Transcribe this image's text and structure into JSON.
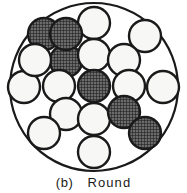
{
  "figure": {
    "caption_label": "(b)",
    "caption_title": "Round",
    "outline_color": "#1a1a1a",
    "open_fill_color": "#f7f7f5",
    "hatched_fill_color": "#5a5a5a",
    "background_color": "#ffffff",
    "outer_circle": {
      "cx": 94,
      "cy": 87,
      "r": 84,
      "stroke_width": 2.2
    },
    "element_radius": 16,
    "element_stroke_width": 2.4,
    "counts": {
      "total": 19,
      "hatched": 7,
      "open": 12
    },
    "elements": [
      {
        "id": "e01",
        "cx": 94,
        "cy": 23,
        "type": "open"
      },
      {
        "id": "e02",
        "cx": 44,
        "cy": 34,
        "type": "hatched"
      },
      {
        "id": "e03",
        "cx": 145,
        "cy": 36,
        "type": "open"
      },
      {
        "id": "e04",
        "cx": 66,
        "cy": 61,
        "type": "hatched"
      },
      {
        "id": "e05",
        "cx": 94,
        "cy": 55,
        "type": "open"
      },
      {
        "id": "e06",
        "cx": 124,
        "cy": 60,
        "type": "open"
      },
      {
        "id": "e07",
        "cx": 24,
        "cy": 87,
        "type": "open"
      },
      {
        "id": "e08",
        "cx": 59,
        "cy": 86,
        "type": "open"
      },
      {
        "id": "e09",
        "cx": 94,
        "cy": 86,
        "type": "hatched"
      },
      {
        "id": "e10",
        "cx": 129,
        "cy": 86,
        "type": "open"
      },
      {
        "id": "e11",
        "cx": 163,
        "cy": 87,
        "type": "open"
      },
      {
        "id": "e12",
        "cx": 66,
        "cy": 114,
        "type": "open"
      },
      {
        "id": "e13",
        "cx": 94,
        "cy": 119,
        "type": "open"
      },
      {
        "id": "e14",
        "cx": 124,
        "cy": 112,
        "type": "hatched"
      },
      {
        "id": "e15",
        "cx": 145,
        "cy": 133,
        "type": "hatched"
      },
      {
        "id": "e16",
        "cx": 44,
        "cy": 133,
        "type": "open"
      },
      {
        "id": "e17",
        "cx": 94,
        "cy": 152,
        "type": "open"
      },
      {
        "id": "e18",
        "cx": 66,
        "cy": 34,
        "type": "hatched"
      },
      {
        "id": "e19",
        "cx": 35,
        "cy": 60,
        "type": "open"
      }
    ]
  }
}
